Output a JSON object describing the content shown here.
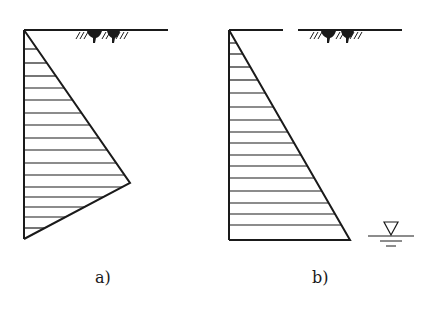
{
  "figure": {
    "type": "earth-pressure-distribution",
    "colors": {
      "line": "#1a1a1a",
      "background": "#ffffff"
    },
    "panels": [
      {
        "id": "a",
        "label": "a)",
        "shape": "triangle-with-kink",
        "wall": {
          "x": 24,
          "y_top": 30,
          "y_bottom": 239
        },
        "ground_line": [
          [
            24,
            30,
            168,
            30
          ]
        ],
        "outline": [
          [
            24,
            30
          ],
          [
            130,
            183
          ],
          [
            24,
            239
          ]
        ],
        "hatch_y": [
          49,
          63,
          76,
          88,
          100,
          113,
          125,
          138,
          150,
          163,
          175,
          187,
          197,
          207,
          217,
          228
        ],
        "ground_symbol": {
          "x": 76,
          "y": 31
        }
      },
      {
        "id": "b",
        "label": "b)",
        "shape": "triangle",
        "wall": {
          "x": 229,
          "y_top": 30,
          "y_bottom": 240
        },
        "ground_line": [
          [
            229,
            30,
            283,
            30
          ],
          [
            298,
            30,
            402,
            30
          ]
        ],
        "outline": [
          [
            229,
            30
          ],
          [
            350,
            240
          ],
          [
            229,
            240
          ]
        ],
        "hatch_y": [
          43,
          54,
          67,
          80,
          93,
          107,
          120,
          132,
          143,
          155,
          166,
          178,
          191,
          203,
          214,
          225
        ],
        "ground_symbol": {
          "x": 310,
          "y": 31
        },
        "water_table_symbol": {
          "x": 391,
          "y": 236
        }
      }
    ]
  }
}
